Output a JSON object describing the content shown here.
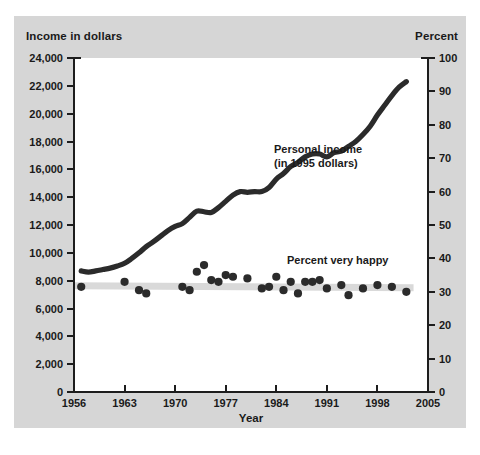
{
  "figure": {
    "left_axis_header": "Income in dollars",
    "right_axis_header": "Percent",
    "x_axis_title": "Year",
    "background_color": "#d6d6d6",
    "plot_background_color": "#ffffff",
    "series_color": "#2b2b2b",
    "band_color": "#d9d9d9"
  },
  "annotations": {
    "income_line1": "Personal income",
    "income_line2": "(in 1995 dollars)",
    "happy": "Percent very happy"
  },
  "chart_data": {
    "type": "line",
    "title": "",
    "xlabel": "Year",
    "ylabel": "Income in dollars",
    "y2label": "Percent",
    "xlim": [
      1956,
      2005
    ],
    "ylim": [
      0,
      24000
    ],
    "y2lim": [
      0,
      100
    ],
    "grid": false,
    "legend": "annotated in-plot",
    "x_ticks": [
      1956,
      1963,
      1970,
      1977,
      1984,
      1991,
      1998,
      2005
    ],
    "x_tick_labels": [
      "1956",
      "1963",
      "1970",
      "1977",
      "1984",
      "1991",
      "1998",
      "2005"
    ],
    "y_ticks": [
      0,
      2000,
      4000,
      6000,
      8000,
      10000,
      12000,
      14000,
      16000,
      18000,
      20000,
      22000,
      24000
    ],
    "y_tick_labels": [
      "0",
      "2,000",
      "4,000",
      "6,000",
      "8,000",
      "10,000",
      "12,000",
      "14,000",
      "16,000",
      "18,000",
      "20,000",
      "22,000",
      "24,000"
    ],
    "y2_ticks": [
      0,
      10,
      20,
      30,
      40,
      50,
      60,
      70,
      80,
      90,
      100
    ],
    "y2_tick_labels": [
      "0",
      "10",
      "20",
      "30",
      "40",
      "50",
      "60",
      "70",
      "80",
      "90",
      "100"
    ],
    "series": [
      {
        "name": "Personal income (in 1995 dollars)",
        "type": "line",
        "axis": "left",
        "color": "#2b2b2b",
        "x": [
          1957,
          1958,
          1959,
          1960,
          1961,
          1962,
          1963,
          1964,
          1965,
          1966,
          1967,
          1968,
          1969,
          1970,
          1971,
          1972,
          1973,
          1974,
          1975,
          1976,
          1977,
          1978,
          1979,
          1980,
          1981,
          1982,
          1983,
          1984,
          1985,
          1986,
          1987,
          1988,
          1989,
          1990,
          1991,
          1992,
          1993,
          1994,
          1995,
          1996,
          1997,
          1998,
          1999,
          2000,
          2001,
          2002
        ],
        "y": [
          8700,
          8620,
          8700,
          8800,
          8900,
          9050,
          9250,
          9600,
          10000,
          10450,
          10800,
          11200,
          11600,
          11900,
          12100,
          12550,
          13000,
          12950,
          12900,
          13250,
          13700,
          14150,
          14400,
          14350,
          14400,
          14400,
          14700,
          15300,
          15700,
          16200,
          16500,
          16900,
          17100,
          17100,
          16900,
          17200,
          17300,
          17650,
          18000,
          18500,
          19100,
          19900,
          20600,
          21300,
          21900,
          22300
        ]
      },
      {
        "name": "Percent very happy",
        "type": "scatter",
        "axis": "right",
        "color": "#2b2b2b",
        "x": [
          1957,
          1963,
          1965,
          1966,
          1971,
          1972,
          1973,
          1974,
          1975,
          1976,
          1977,
          1978,
          1980,
          1982,
          1983,
          1984,
          1985,
          1986,
          1987,
          1988,
          1989,
          1990,
          1991,
          1993,
          1994,
          1996,
          1998,
          2000,
          2002
        ],
        "y": [
          31.5,
          33.0,
          30.5,
          29.5,
          31.5,
          30.5,
          36.0,
          38.0,
          33.5,
          33.0,
          35.0,
          34.5,
          34.0,
          31.0,
          31.5,
          34.5,
          30.5,
          33.0,
          29.5,
          33.0,
          33.0,
          33.5,
          31.0,
          32.0,
          29.0,
          31.0,
          32.0,
          31.5,
          30.0
        ]
      },
      {
        "name": "Percent very happy trend band",
        "type": "area",
        "axis": "right",
        "color": "#d9d9d9",
        "x": [
          1956,
          2003
        ],
        "y": [
          31.8,
          31.2
        ]
      }
    ]
  }
}
